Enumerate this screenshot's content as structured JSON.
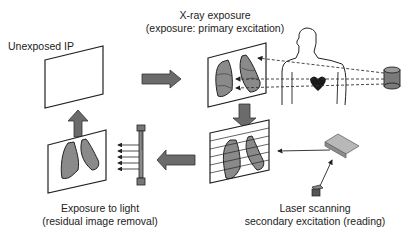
{
  "labels": {
    "unexposed": "Unexposed IP",
    "xray_line1": "X-ray exposure",
    "xray_line2": "(exposure: primary excitation)",
    "laser_line1": "Laser scanning",
    "laser_line2": "secondary excitation (reading)",
    "light_line1": "Exposure to light",
    "light_line2": "(residual image removal)"
  },
  "colors": {
    "arrow_fill": "#6b6b6b",
    "lung_fill": "#8a8a8a",
    "outline": "#222222",
    "heart": "#1a1a1a"
  },
  "icons": {
    "xray_source": "x-ray-tube-icon",
    "laser_source": "laser-icon",
    "mirror": "mirror-icon",
    "lamp": "fluorescent-lamp-icon",
    "patient": "human-torso-icon",
    "heart": "heart-icon"
  }
}
